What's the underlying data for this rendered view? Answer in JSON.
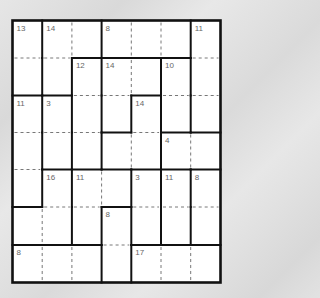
{
  "puzzle": {
    "type": "killer-sudoku-style cage grid",
    "rows": 7,
    "cols": 7,
    "cages": [
      {
        "sum": "13",
        "cells": [
          [
            0,
            0
          ],
          [
            1,
            0
          ]
        ]
      },
      {
        "sum": "14",
        "cells": [
          [
            0,
            1
          ],
          [
            0,
            2
          ],
          [
            1,
            1
          ]
        ]
      },
      {
        "sum": "8",
        "cells": [
          [
            0,
            3
          ],
          [
            0,
            4
          ],
          [
            0,
            5
          ]
        ]
      },
      {
        "sum": "11",
        "cells": [
          [
            0,
            6
          ],
          [
            1,
            6
          ],
          [
            2,
            6
          ]
        ]
      },
      {
        "sum": "12",
        "cells": [
          [
            1,
            2
          ],
          [
            2,
            2
          ],
          [
            3,
            2
          ]
        ]
      },
      {
        "sum": "14",
        "cells": [
          [
            1,
            3
          ],
          [
            1,
            4
          ],
          [
            2,
            3
          ]
        ]
      },
      {
        "sum": "10",
        "cells": [
          [
            1,
            5
          ],
          [
            2,
            5
          ]
        ]
      },
      {
        "sum": "11",
        "cells": [
          [
            2,
            0
          ],
          [
            3,
            0
          ],
          [
            4,
            0
          ]
        ]
      },
      {
        "sum": "3",
        "cells": [
          [
            2,
            1
          ],
          [
            3,
            1
          ]
        ]
      },
      {
        "sum": "14",
        "cells": [
          [
            2,
            4
          ],
          [
            3,
            3
          ],
          [
            3,
            4
          ]
        ]
      },
      {
        "sum": "4",
        "cells": [
          [
            3,
            5
          ],
          [
            3,
            6
          ]
        ]
      },
      {
        "sum": "16",
        "cells": [
          [
            4,
            1
          ],
          [
            5,
            0
          ],
          [
            5,
            1
          ]
        ]
      },
      {
        "sum": "11",
        "cells": [
          [
            4,
            2
          ],
          [
            4,
            3
          ],
          [
            5,
            2
          ]
        ]
      },
      {
        "sum": "3",
        "cells": [
          [
            4,
            4
          ],
          [
            5,
            4
          ]
        ]
      },
      {
        "sum": "11",
        "cells": [
          [
            4,
            5
          ],
          [
            5,
            5
          ]
        ]
      },
      {
        "sum": "8",
        "cells": [
          [
            4,
            6
          ],
          [
            5,
            6
          ]
        ]
      },
      {
        "sum": "8",
        "cells": [
          [
            5,
            3
          ],
          [
            6,
            3
          ]
        ]
      },
      {
        "sum": "8",
        "cells": [
          [
            6,
            0
          ],
          [
            6,
            1
          ],
          [
            6,
            2
          ]
        ]
      },
      {
        "sum": "17",
        "cells": [
          [
            6,
            4
          ],
          [
            6,
            5
          ],
          [
            6,
            6
          ]
        ]
      }
    ],
    "values": []
  },
  "colors": {
    "grid_line": "#111111",
    "cage_dash": "#555555",
    "clue_text": "#666666",
    "cell_fill": "#ffffff"
  }
}
